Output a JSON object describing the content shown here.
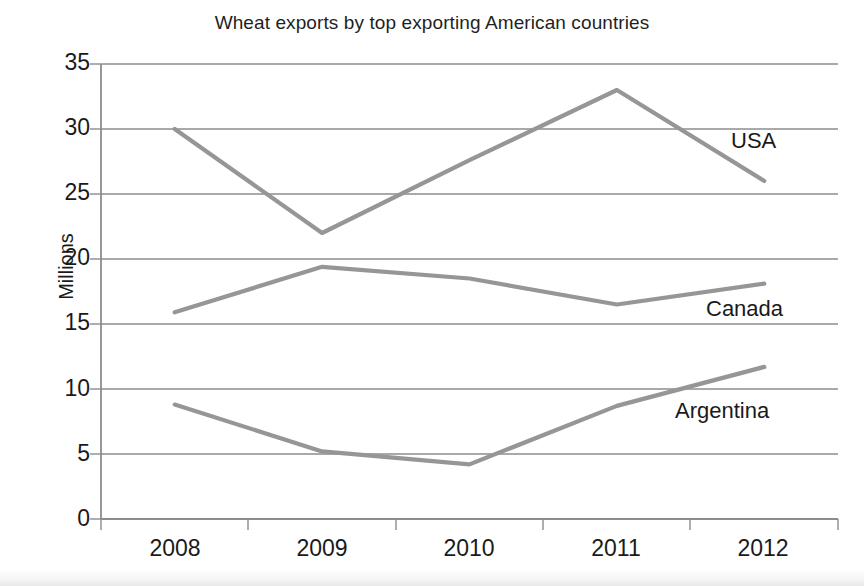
{
  "chart_data": {
    "type": "line",
    "title": "Wheat exports by top exporting American countries",
    "xlabel": "",
    "ylabel": "Millions",
    "categories": [
      "2008",
      "2009",
      "2010",
      "2011",
      "2012"
    ],
    "ylim": [
      0,
      35
    ],
    "ytick_step": 5,
    "yticks": [
      "0",
      "5",
      "10",
      "15",
      "20",
      "25",
      "30",
      "35"
    ],
    "grid": true,
    "legend_position": "inline-right-labels",
    "series": [
      {
        "name": "USA",
        "color": "#969696",
        "values": [
          30,
          22,
          27.6,
          33,
          26
        ]
      },
      {
        "name": "Canada",
        "color": "#969696",
        "values": [
          15.9,
          19.4,
          18.5,
          16.5,
          18.1
        ]
      },
      {
        "name": "Argentina",
        "color": "#969696",
        "values": [
          8.8,
          5.2,
          4.2,
          8.7,
          11.7
        ]
      }
    ],
    "annotations": [
      {
        "text": "USA",
        "series": "USA"
      },
      {
        "text": "Canada",
        "series": "Canada"
      },
      {
        "text": "Argentina",
        "series": "Argentina"
      }
    ],
    "colors": {
      "line": "#969696",
      "grid": "#8c8c8c",
      "axis": "#8c8c8c",
      "text": "#1a1a1a",
      "background": "#ffffff"
    }
  }
}
